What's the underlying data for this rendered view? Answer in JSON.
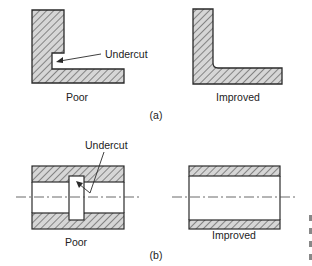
{
  "figure": {
    "part_a": {
      "tag": "(a)",
      "poor": {
        "label": "Poor",
        "callout": "Undercut"
      },
      "improved": {
        "label": "Improved"
      }
    },
    "part_b": {
      "tag": "(b)",
      "poor": {
        "label": "Poor",
        "callout": "Undercut"
      },
      "improved": {
        "label": "Improved"
      }
    },
    "colors": {
      "stroke": "#2a2a2a",
      "hatch": "#555555",
      "fill": "#d9d9d9",
      "background": "#ffffff"
    }
  }
}
